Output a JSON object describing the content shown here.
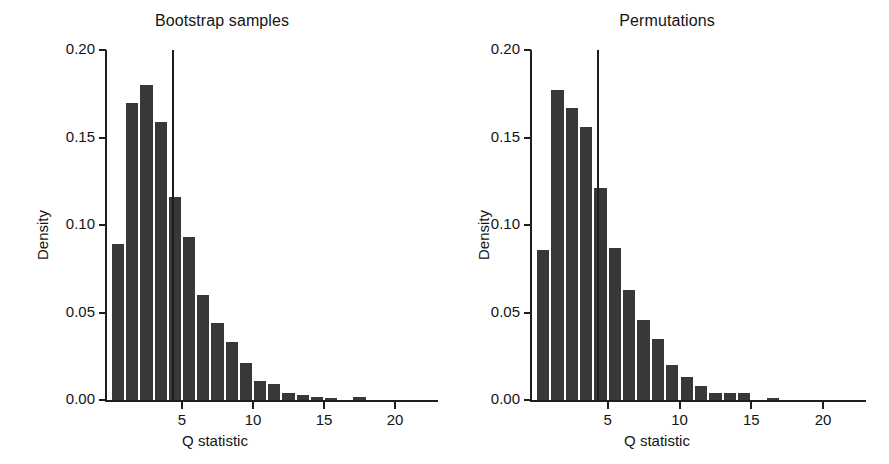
{
  "figure": {
    "background": "#ffffff",
    "bar_color": "#383838",
    "axis_color": "#1e1e1e",
    "text_color": "#141414"
  },
  "chart_data": [
    {
      "type": "bar",
      "panel_id": "bootstrap",
      "title": "Bootstrap samples",
      "xlabel": "Q statistic",
      "ylabel": "Density",
      "xlim": [
        0,
        23
      ],
      "ylim": [
        0.0,
        0.2
      ],
      "grid": false,
      "legend": "none",
      "x_ticks": [
        5,
        10,
        15,
        20
      ],
      "x_tick_labels": [
        "5",
        "10",
        "15",
        "20"
      ],
      "y_ticks": [
        0.0,
        0.05,
        0.1,
        0.15,
        0.2
      ],
      "y_tick_labels": [
        "0.00",
        "0.05",
        "0.10",
        "0.15",
        "0.20"
      ],
      "bin_width": 1,
      "bin_starts": [
        0,
        1,
        2,
        3,
        4,
        5,
        6,
        7,
        8,
        9,
        10,
        11,
        12,
        13,
        14,
        15,
        16,
        17,
        18,
        19,
        20,
        21
      ],
      "values": [
        0.089,
        0.17,
        0.18,
        0.159,
        0.116,
        0.093,
        0.06,
        0.044,
        0.033,
        0.021,
        0.011,
        0.009,
        0.004,
        0.003,
        0.002,
        0.001,
        0.0,
        0.002,
        0.0,
        0.0,
        0.0,
        0.0
      ],
      "annotations": [
        {
          "kind": "vertical-line",
          "x": 4.35,
          "y_top": 0.2,
          "y_bottom": 0.0
        }
      ]
    },
    {
      "type": "bar",
      "panel_id": "permutations",
      "title": "Permutations",
      "xlabel": "Q statistic",
      "ylabel": "Density",
      "xlim": [
        0,
        23
      ],
      "ylim": [
        0.0,
        0.2
      ],
      "grid": false,
      "legend": "none",
      "x_ticks": [
        5,
        10,
        15,
        20
      ],
      "x_tick_labels": [
        "5",
        "10",
        "15",
        "20"
      ],
      "y_ticks": [
        0.0,
        0.05,
        0.1,
        0.15,
        0.2
      ],
      "y_tick_labels": [
        "0.00",
        "0.05",
        "0.10",
        "0.15",
        "0.20"
      ],
      "bin_width": 1,
      "bin_starts": [
        0,
        1,
        2,
        3,
        4,
        5,
        6,
        7,
        8,
        9,
        10,
        11,
        12,
        13,
        14,
        15,
        16,
        17,
        18,
        19,
        20,
        21
      ],
      "values": [
        0.086,
        0.177,
        0.167,
        0.156,
        0.121,
        0.087,
        0.063,
        0.046,
        0.035,
        0.02,
        0.013,
        0.008,
        0.004,
        0.004,
        0.004,
        0.0,
        0.001,
        0.0,
        0.0,
        0.0,
        0.0,
        0.0
      ],
      "annotations": [
        {
          "kind": "vertical-line",
          "x": 4.35,
          "y_top": 0.2,
          "y_bottom": 0.0
        }
      ]
    }
  ]
}
